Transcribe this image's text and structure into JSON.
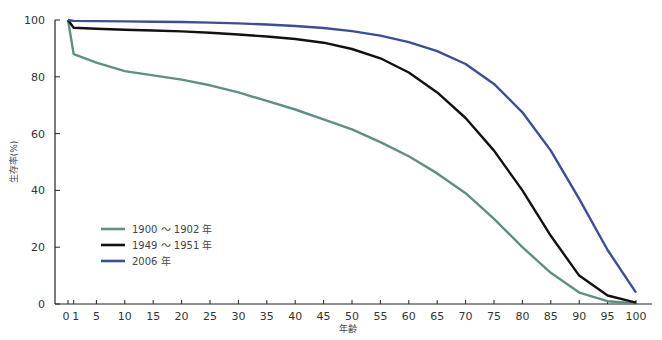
{
  "chart_data": {
    "type": "line",
    "title": "",
    "xlabel": "年齢",
    "ylabel": "生存率(%)",
    "xlim": [
      0,
      100
    ],
    "ylim": [
      0,
      100
    ],
    "grid": false,
    "legend_position": "lower-left-inside",
    "x_ticks": [
      "0",
      "1",
      "5",
      "10",
      "15",
      "20",
      "25",
      "30",
      "35",
      "40",
      "45",
      "50",
      "55",
      "60",
      "65",
      "70",
      "75",
      "80",
      "85",
      "90",
      "95",
      "100"
    ],
    "y_ticks": [
      "0",
      "20",
      "40",
      "60",
      "80",
      "100"
    ],
    "x": [
      0,
      1,
      5,
      10,
      15,
      20,
      25,
      30,
      35,
      40,
      45,
      50,
      55,
      60,
      65,
      70,
      75,
      80,
      85,
      90,
      95,
      100
    ],
    "series": [
      {
        "name": "1900 ～ 1902 年",
        "color": "#5f8f84",
        "values": [
          100,
          88,
          85,
          82,
          80.5,
          79,
          77,
          74.5,
          71.5,
          68.5,
          65,
          61.5,
          57,
          52,
          46,
          39,
          30,
          20,
          11,
          4,
          1,
          0.2
        ]
      },
      {
        "name": "1949 ～ 1951 年",
        "color": "#111111",
        "values": [
          100,
          97.3,
          96.9,
          96.6,
          96.3,
          96,
          95.5,
          94.9,
          94.2,
          93.3,
          92,
          89.8,
          86.5,
          81.5,
          74.5,
          65.5,
          54,
          40,
          24,
          10,
          3,
          0.5
        ]
      },
      {
        "name": "2006 年",
        "color": "#3b4f95",
        "values": [
          100,
          99.7,
          99.6,
          99.5,
          99.4,
          99.3,
          99.1,
          98.8,
          98.4,
          97.9,
          97.2,
          96.1,
          94.5,
          92.2,
          89,
          84.5,
          77.5,
          67.5,
          54,
          37,
          19,
          4
        ]
      }
    ]
  },
  "legend": [
    {
      "label": "1900 ～ 1902 年",
      "color": "#5f8f84"
    },
    {
      "label": "1949 ～ 1951 年",
      "color": "#111111"
    },
    {
      "label": "2006 年",
      "color": "#3b4f95"
    }
  ]
}
